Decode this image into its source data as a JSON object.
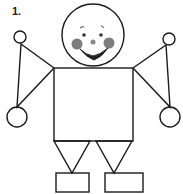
{
  "figure": {
    "number_label": "1."
  },
  "colors": {
    "stroke": "#1a1a1a",
    "cheek": "#555555",
    "background": "#ffffff"
  }
}
